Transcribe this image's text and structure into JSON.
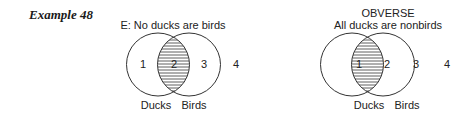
{
  "example_label": "Example 48",
  "diagrams": [
    {
      "title": "",
      "subtitle": "E: No ducks are birds",
      "regions": [
        "1",
        "2",
        "3",
        "4"
      ],
      "left_label": "Ducks",
      "right_label": "Birds",
      "shaded_region": "2"
    },
    {
      "title": "OBVERSE",
      "subtitle": "All ducks are nonbirds",
      "regions": [
        "1",
        "2",
        "3",
        "4"
      ],
      "left_label": "Ducks",
      "right_label": "Birds",
      "shaded_region": "2"
    }
  ]
}
